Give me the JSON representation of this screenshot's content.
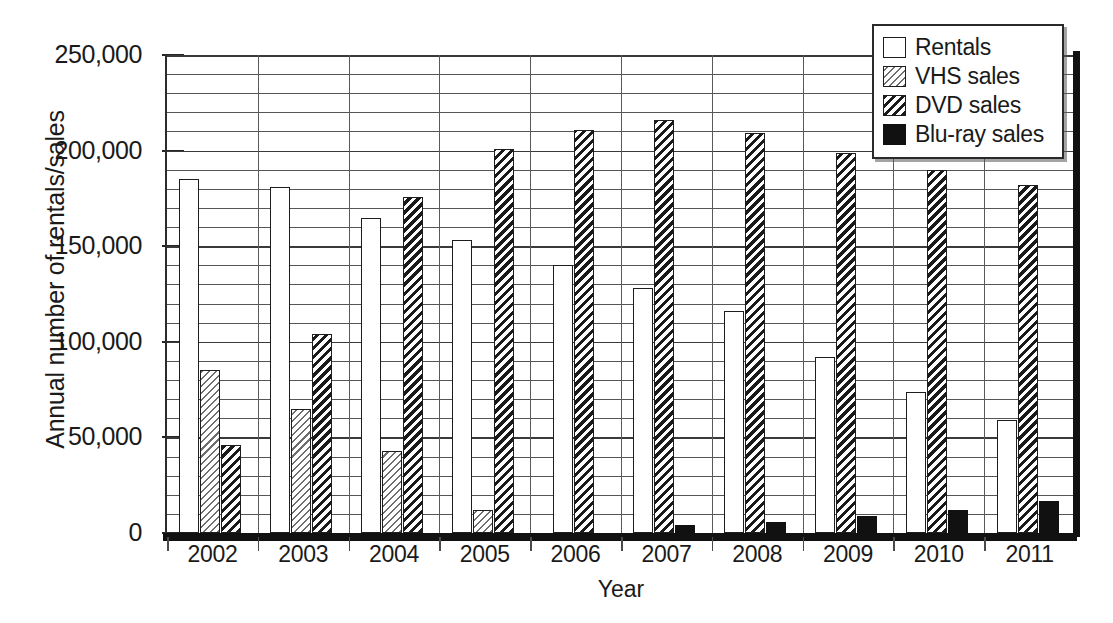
{
  "chart_data": {
    "type": "bar",
    "title": "",
    "xlabel": "Year",
    "ylabel": "Annual number of rentals/sales",
    "categories": [
      "2002",
      "2003",
      "2004",
      "2005",
      "2006",
      "2007",
      "2008",
      "2009",
      "2010",
      "2011"
    ],
    "series": [
      {
        "name": "Rentals",
        "values": [
          185000,
          181000,
          165000,
          153000,
          140000,
          128000,
          116000,
          92000,
          74000,
          59000
        ]
      },
      {
        "name": "VHS sales",
        "values": [
          85000,
          65000,
          43000,
          12000,
          0,
          0,
          0,
          0,
          0,
          0
        ]
      },
      {
        "name": "DVD sales",
        "values": [
          46000,
          104000,
          176000,
          201000,
          211000,
          216000,
          209000,
          199000,
          190000,
          182000
        ]
      },
      {
        "name": "Blu-ray sales",
        "values": [
          0,
          0,
          0,
          0,
          0,
          4000,
          6000,
          9000,
          12000,
          17000
        ]
      }
    ],
    "ylim": [
      0,
      250000
    ],
    "xlim_categories": 10,
    "y_major_ticks": [
      "0",
      "50,000",
      "100,000",
      "150,000",
      "200,000",
      "250,000"
    ],
    "y_major_tick_values": [
      0,
      50000,
      100000,
      150000,
      200000,
      250000
    ],
    "y_minor_interval": 10000,
    "grid": "horizontal-minor-and-major-plus-vertical-category-separators",
    "legend_position": "top-right-inside",
    "colors": {
      "rentals": "#ffffff",
      "vhs": "#6e6e6e",
      "dvd": "#1a1a1a",
      "bluray": "#111111",
      "axis": "#1a1a1a",
      "gridline": "#555555"
    }
  },
  "axes": {
    "y_title": "Annual number of rentals/sales",
    "x_title": "Year",
    "y_ticks": [
      "250,000",
      "200,000",
      "150,000",
      "100,000",
      "50,000",
      "0"
    ],
    "x_ticks": [
      "2002",
      "2003",
      "2004",
      "2005",
      "2006",
      "2007",
      "2008",
      "2009",
      "2010",
      "2011"
    ]
  },
  "legend": {
    "entries": [
      {
        "label": "Rentals",
        "swatch": "white-empty"
      },
      {
        "label": "VHS sales",
        "swatch": "light-diagonal-hatch"
      },
      {
        "label": "DVD sales",
        "swatch": "dark-diagonal-hatch"
      },
      {
        "label": "Blu-ray sales",
        "swatch": "solid-black"
      }
    ]
  }
}
